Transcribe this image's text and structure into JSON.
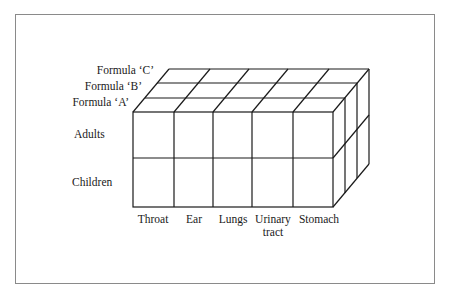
{
  "diagram": {
    "type": "3d-cube-matrix",
    "layers": [
      {
        "label": "Formula ‘C’"
      },
      {
        "label": "Formula ‘B’"
      },
      {
        "label": "Formula ‘A’"
      }
    ],
    "rows": [
      {
        "label": "Adults"
      },
      {
        "label": "Children"
      }
    ],
    "columns": [
      {
        "label": "Throat"
      },
      {
        "label": "Ear"
      },
      {
        "label": "Lungs"
      },
      {
        "label": "Urinary",
        "label2": "tract"
      },
      {
        "label": "Stomach"
      }
    ],
    "line_color": "#1a1a1a",
    "frame_color": "#8a8a8a"
  }
}
